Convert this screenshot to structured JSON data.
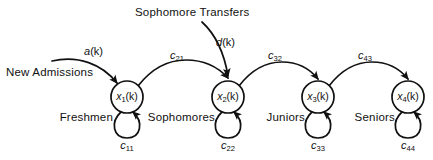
{
  "figure": {
    "type": "state-transition-diagram",
    "width": 433,
    "height": 160,
    "background_color": "#ffffff",
    "ink_color": "#111111"
  },
  "annotations": {
    "sophomore_transfers": "Sophomore Transfers",
    "new_admissions": "New Admissions"
  },
  "inputs": [
    {
      "id": "a",
      "label_main": "a",
      "label_arg": "(k)",
      "source_text": "New Admissions",
      "target_node": "x1"
    },
    {
      "id": "d",
      "label_main": "d",
      "label_arg": "(k)",
      "source_text": "Sophomore Transfers",
      "target_node": "x2"
    }
  ],
  "nodes": [
    {
      "id": "x1",
      "state_main": "x",
      "state_sub": "1",
      "state_arg": "(k)",
      "class_label": "Freshmen",
      "cx": 127,
      "cy": 97,
      "r": 16
    },
    {
      "id": "x2",
      "state_main": "x",
      "state_sub": "2",
      "state_arg": "(k)",
      "class_label": "Sophomores",
      "cx": 228,
      "cy": 97,
      "r": 16
    },
    {
      "id": "x3",
      "state_main": "x",
      "state_sub": "3",
      "state_arg": "(k)",
      "class_label": "Juniors",
      "cx": 318,
      "cy": 97,
      "r": 16
    },
    {
      "id": "x4",
      "state_main": "x",
      "state_sub": "4",
      "state_arg": "(k)",
      "class_label": "Seniors",
      "cx": 408,
      "cy": 97,
      "r": 16
    }
  ],
  "transition_edges": [
    {
      "id": "c21",
      "coef_main": "c",
      "coef_sub": "21",
      "from": "x1",
      "to": "x2"
    },
    {
      "id": "c32",
      "coef_main": "c",
      "coef_sub": "32",
      "from": "x2",
      "to": "x3"
    },
    {
      "id": "c43",
      "coef_main": "c",
      "coef_sub": "43",
      "from": "x3",
      "to": "x4"
    }
  ],
  "self_loops": [
    {
      "id": "c11",
      "coef_main": "c",
      "coef_sub": "11",
      "node": "x1"
    },
    {
      "id": "c22",
      "coef_main": "c",
      "coef_sub": "22",
      "node": "x2"
    },
    {
      "id": "c33",
      "coef_main": "c",
      "coef_sub": "33",
      "node": "x3"
    },
    {
      "id": "c44",
      "coef_main": "c",
      "coef_sub": "44",
      "node": "x4"
    }
  ]
}
